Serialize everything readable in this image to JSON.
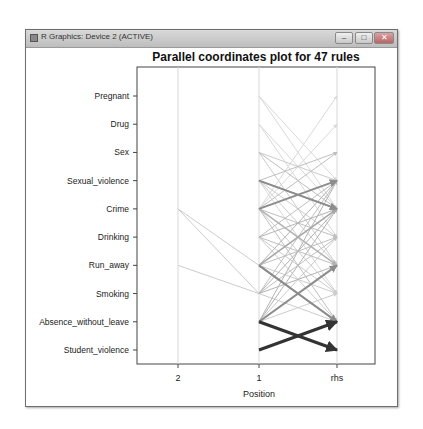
{
  "window": {
    "title": "R Graphics: Device 2 (ACTIVE)",
    "buttons": {
      "minimize": "–",
      "maximize": "□",
      "close": "✕"
    }
  },
  "chart_data": {
    "type": "parallel_coordinates",
    "title": "Parallel coordinates plot for 47 rules",
    "xlabel": "Position",
    "ylabel": "",
    "x_ticks": [
      "2",
      "1",
      "rhs"
    ],
    "y_ticks": [
      "Pregnant",
      "Drug",
      "Sex",
      "Sexual_violence",
      "Crime",
      "Drinking",
      "Run_away",
      "Smoking",
      "Absence_without_leave",
      "Student_violence"
    ],
    "legend": null,
    "grid": false,
    "rule_count": 47,
    "note": "Lines connect LHS items (positions 2 and 1) to RHS item; darker/thicker arrows indicate higher lift/support",
    "segments": [
      {
        "from_axis": "2",
        "from": "Crime",
        "to_axis": "1",
        "to": "Run_away",
        "shade": 0.8,
        "width": 1
      },
      {
        "from_axis": "2",
        "from": "Crime",
        "to_axis": "1",
        "to": "Smoking",
        "shade": 0.8,
        "width": 1
      },
      {
        "from_axis": "2",
        "from": "Run_away",
        "to_axis": "1",
        "to": "Smoking",
        "shade": 0.8,
        "width": 1
      },
      {
        "from_axis": "1",
        "from": "Absence_without_leave",
        "to_axis": "rhs",
        "to": "Student_violence",
        "shade": 0.2,
        "width": 3
      },
      {
        "from_axis": "1",
        "from": "Student_violence",
        "to_axis": "rhs",
        "to": "Absence_without_leave",
        "shade": 0.2,
        "width": 3
      },
      {
        "from_axis": "1",
        "from": "Sexual_violence",
        "to_axis": "rhs",
        "to": "Crime",
        "shade": 0.55,
        "width": 2
      },
      {
        "from_axis": "1",
        "from": "Crime",
        "to_axis": "rhs",
        "to": "Sexual_violence",
        "shade": 0.55,
        "width": 2
      },
      {
        "from_axis": "1",
        "from": "Run_away",
        "to_axis": "rhs",
        "to": "Absence_without_leave",
        "shade": 0.55,
        "width": 2
      },
      {
        "from_axis": "1",
        "from": "Absence_without_leave",
        "to_axis": "rhs",
        "to": "Run_away",
        "shade": 0.55,
        "width": 2
      },
      {
        "from_axis": "1",
        "from": "Pregnant",
        "to_axis": "rhs",
        "to": "Sexual_violence",
        "shade": 0.85,
        "width": 1
      },
      {
        "from_axis": "1",
        "from": "Pregnant",
        "to_axis": "rhs",
        "to": "Crime",
        "shade": 0.85,
        "width": 1
      },
      {
        "from_axis": "1",
        "from": "Drug",
        "to_axis": "rhs",
        "to": "Crime",
        "shade": 0.85,
        "width": 1
      },
      {
        "from_axis": "1",
        "from": "Drug",
        "to_axis": "rhs",
        "to": "Drinking",
        "shade": 0.85,
        "width": 1
      },
      {
        "from_axis": "1",
        "from": "Sex",
        "to_axis": "rhs",
        "to": "Crime",
        "shade": 0.75,
        "width": 1
      },
      {
        "from_axis": "1",
        "from": "Sex",
        "to_axis": "rhs",
        "to": "Run_away",
        "shade": 0.8,
        "width": 1
      },
      {
        "from_axis": "1",
        "from": "Sexual_violence",
        "to_axis": "rhs",
        "to": "Sex",
        "shade": 0.75,
        "width": 1
      },
      {
        "from_axis": "1",
        "from": "Sexual_violence",
        "to_axis": "rhs",
        "to": "Drinking",
        "shade": 0.8,
        "width": 1
      },
      {
        "from_axis": "1",
        "from": "Sexual_violence",
        "to_axis": "rhs",
        "to": "Run_away",
        "shade": 0.8,
        "width": 1
      },
      {
        "from_axis": "1",
        "from": "Crime",
        "to_axis": "rhs",
        "to": "Pregnant",
        "shade": 0.85,
        "width": 1
      },
      {
        "from_axis": "1",
        "from": "Crime",
        "to_axis": "rhs",
        "to": "Drug",
        "shade": 0.85,
        "width": 1
      },
      {
        "from_axis": "1",
        "from": "Crime",
        "to_axis": "rhs",
        "to": "Sex",
        "shade": 0.75,
        "width": 1
      },
      {
        "from_axis": "1",
        "from": "Crime",
        "to_axis": "rhs",
        "to": "Drinking",
        "shade": 0.75,
        "width": 1
      },
      {
        "from_axis": "1",
        "from": "Crime",
        "to_axis": "rhs",
        "to": "Run_away",
        "shade": 0.7,
        "width": 1.5
      },
      {
        "from_axis": "1",
        "from": "Crime",
        "to_axis": "rhs",
        "to": "Smoking",
        "shade": 0.8,
        "width": 1
      },
      {
        "from_axis": "1",
        "from": "Drinking",
        "to_axis": "rhs",
        "to": "Sexual_violence",
        "shade": 0.75,
        "width": 1
      },
      {
        "from_axis": "1",
        "from": "Drinking",
        "to_axis": "rhs",
        "to": "Crime",
        "shade": 0.7,
        "width": 1
      },
      {
        "from_axis": "1",
        "from": "Drinking",
        "to_axis": "rhs",
        "to": "Run_away",
        "shade": 0.75,
        "width": 1
      },
      {
        "from_axis": "1",
        "from": "Drinking",
        "to_axis": "rhs",
        "to": "Smoking",
        "shade": 0.8,
        "width": 1
      },
      {
        "from_axis": "1",
        "from": "Run_away",
        "to_axis": "rhs",
        "to": "Sexual_violence",
        "shade": 0.7,
        "width": 1
      },
      {
        "from_axis": "1",
        "from": "Run_away",
        "to_axis": "rhs",
        "to": "Crime",
        "shade": 0.65,
        "width": 1.5
      },
      {
        "from_axis": "1",
        "from": "Run_away",
        "to_axis": "rhs",
        "to": "Drinking",
        "shade": 0.75,
        "width": 1
      },
      {
        "from_axis": "1",
        "from": "Run_away",
        "to_axis": "rhs",
        "to": "Smoking",
        "shade": 0.8,
        "width": 1
      },
      {
        "from_axis": "1",
        "from": "Smoking",
        "to_axis": "rhs",
        "to": "Sexual_violence",
        "shade": 0.75,
        "width": 1
      },
      {
        "from_axis": "1",
        "from": "Smoking",
        "to_axis": "rhs",
        "to": "Crime",
        "shade": 0.7,
        "width": 1
      },
      {
        "from_axis": "1",
        "from": "Smoking",
        "to_axis": "rhs",
        "to": "Drinking",
        "shade": 0.75,
        "width": 1
      },
      {
        "from_axis": "1",
        "from": "Smoking",
        "to_axis": "rhs",
        "to": "Run_away",
        "shade": 0.7,
        "width": 1
      },
      {
        "from_axis": "1",
        "from": "Smoking",
        "to_axis": "rhs",
        "to": "Absence_without_leave",
        "shade": 0.8,
        "width": 1
      },
      {
        "from_axis": "1",
        "from": "Absence_without_leave",
        "to_axis": "rhs",
        "to": "Sexual_violence",
        "shade": 0.7,
        "width": 1
      },
      {
        "from_axis": "1",
        "from": "Absence_without_leave",
        "to_axis": "rhs",
        "to": "Crime",
        "shade": 0.7,
        "width": 1
      },
      {
        "from_axis": "1",
        "from": "Absence_without_leave",
        "to_axis": "rhs",
        "to": "Drinking",
        "shade": 0.8,
        "width": 1
      },
      {
        "from_axis": "1",
        "from": "Absence_without_leave",
        "to_axis": "rhs",
        "to": "Smoking",
        "shade": 0.8,
        "width": 1
      },
      {
        "from_axis": "1",
        "from": "Sexual_violence",
        "to_axis": "rhs",
        "to": "Smoking",
        "shade": 0.85,
        "width": 1
      },
      {
        "from_axis": "1",
        "from": "Sex",
        "to_axis": "rhs",
        "to": "Sexual_violence",
        "shade": 0.8,
        "width": 1
      },
      {
        "from_axis": "1",
        "from": "Drinking",
        "to_axis": "rhs",
        "to": "Absence_without_leave",
        "shade": 0.8,
        "width": 1
      },
      {
        "from_axis": "1",
        "from": "Run_away",
        "to_axis": "rhs",
        "to": "Absence_without_leave",
        "shade": 0.6,
        "width": 1.5
      },
      {
        "from_axis": "1",
        "from": "Crime",
        "to_axis": "rhs",
        "to": "Absence_without_leave",
        "shade": 0.75,
        "width": 1
      },
      {
        "from_axis": "1",
        "from": "Sexual_violence",
        "to_axis": "rhs",
        "to": "Crime",
        "shade": 0.6,
        "width": 1.5
      }
    ]
  }
}
